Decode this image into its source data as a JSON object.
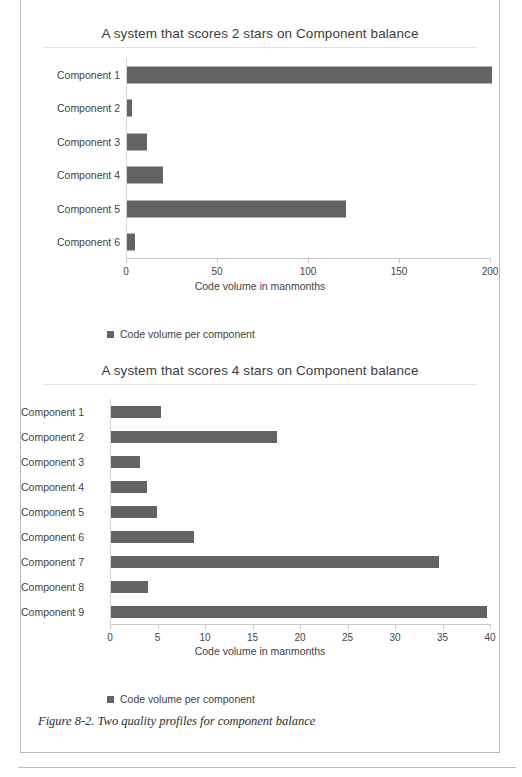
{
  "figure": {
    "caption": "Figure 8-2. Two quality profiles for component balance"
  },
  "charts": [
    {
      "id": "chart-1",
      "title": "A system that scores 2 stars on Component balance",
      "legend_label": "Code volume per component",
      "chart_data": {
        "type": "bar",
        "orientation": "horizontal",
        "title": "A system that scores 2 stars on Component balance",
        "xlabel": "Code volume in manmonths",
        "ylabel": "",
        "xlim": [
          0,
          200
        ],
        "xticks": [
          0,
          50,
          100,
          150,
          200
        ],
        "xtick_labels": [
          "0",
          "50",
          "100",
          "150",
          "200"
        ],
        "grid": false,
        "legend_position": "bottom-left",
        "bar_color": "#636363",
        "categories": [
          "Component 1",
          "Component 2",
          "Component 3",
          "Component 4",
          "Component 5",
          "Component 6"
        ],
        "series": [
          {
            "name": "Code volume per component",
            "values": [
              196,
              3,
              11,
              20,
              118,
              5
            ]
          }
        ]
      }
    },
    {
      "id": "chart-2",
      "title": "A system that scores 4 stars on Component balance",
      "legend_label": "Code volume per component",
      "chart_data": {
        "type": "bar",
        "orientation": "horizontal",
        "title": "A system that scores 4 stars on Component balance",
        "xlabel": "Code volume in manmonths",
        "ylabel": "",
        "xlim": [
          0,
          40
        ],
        "xticks": [
          0,
          5,
          10,
          15,
          20,
          25,
          30,
          35,
          40
        ],
        "xtick_labels": [
          "0",
          "5",
          "10",
          "15",
          "20",
          "25",
          "30",
          "35",
          "40"
        ],
        "grid": false,
        "legend_position": "bottom-left",
        "bar_color": "#636363",
        "categories": [
          "Component 1",
          "Component 2",
          "Component 3",
          "Component 4",
          "Component 5",
          "Component 6",
          "Component 7",
          "Component 8",
          "Component 9"
        ],
        "series": [
          {
            "name": "Code volume per component",
            "values": [
              5.2,
              17.2,
              3.1,
              3.8,
              4.8,
              8.6,
              33.8,
              3.9,
              38.8
            ]
          }
        ]
      }
    }
  ]
}
